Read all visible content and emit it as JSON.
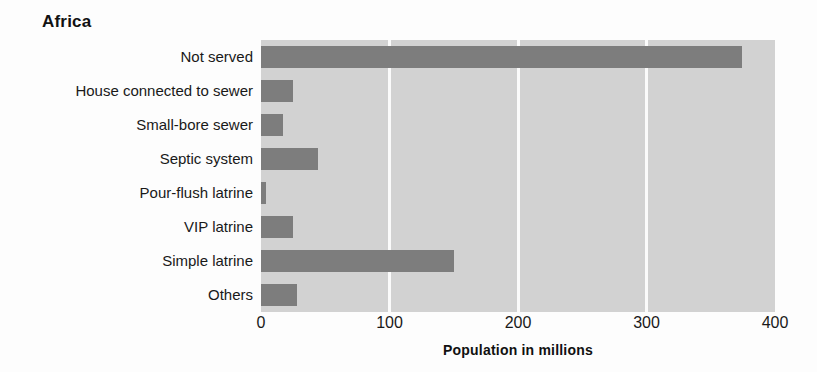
{
  "chart_data": {
    "type": "bar",
    "orientation": "horizontal",
    "title": "Africa",
    "xlabel": "Population in millions",
    "ylabel": "",
    "categories": [
      "Not served",
      "House connected to sewer",
      "Small-bore sewer",
      "Septic system",
      "Pour-flush latrine",
      "VIP latrine",
      "Simple latrine",
      "Others"
    ],
    "values": [
      374,
      25,
      17,
      44,
      4,
      25,
      150,
      28
    ],
    "xlim": [
      0,
      400
    ],
    "xticks": [
      0,
      100,
      200,
      300,
      400
    ],
    "xtick_labels": [
      "0",
      "100",
      "200",
      "300",
      "400"
    ],
    "grid": true,
    "grid_axis": "x",
    "legend": null,
    "colors": {
      "bar": "#7d7d7d",
      "plot_background": "#d2d2d2",
      "gridline": "#fbfbfb",
      "figure_background": "#fdfdfd",
      "text": "#191919"
    }
  }
}
